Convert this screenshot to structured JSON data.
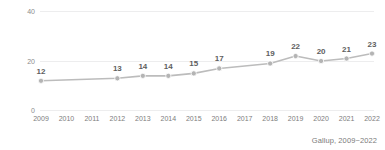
{
  "chart_data": {
    "type": "line",
    "title": "",
    "subtitle": "",
    "xlabel": "",
    "ylabel": "",
    "categories": [
      "2009",
      "2010",
      "2011",
      "2012",
      "2013",
      "2014",
      "2015",
      "2016",
      "2017",
      "2018",
      "2019",
      "2020",
      "2021",
      "2022"
    ],
    "values": [
      12,
      null,
      null,
      13,
      14,
      14,
      15,
      17,
      null,
      19,
      22,
      20,
      21,
      23
    ],
    "point_labels": [
      "12",
      "",
      "",
      "13",
      "14",
      "14",
      "15",
      "17",
      "",
      "19",
      "22",
      "20",
      "21",
      "23"
    ],
    "series": [
      {
        "name": "",
        "x": [
          "2009",
          "2012",
          "2013",
          "2014",
          "2015",
          "2016",
          "2018",
          "2019",
          "2020",
          "2021",
          "2022"
        ],
        "values": [
          12,
          13,
          14,
          14,
          15,
          17,
          19,
          22,
          20,
          21,
          23
        ]
      }
    ],
    "ylim": [
      0,
      40
    ],
    "y_ticks": [
      "0",
      "20",
      "40"
    ],
    "y_tick_values": [
      0,
      20,
      40
    ],
    "x_ticks": [
      "2009",
      "2010",
      "2011",
      "2012",
      "2013",
      "2014",
      "2015",
      "2016",
      "2017",
      "2018",
      "2019",
      "2020",
      "2021",
      "2022"
    ],
    "grid": true,
    "legend": false,
    "legend_position": "none",
    "show_data_labels": true,
    "marker": "circle"
  },
  "source": {
    "note": "Gallup, 2009~2022"
  },
  "colors": {
    "line": "#bcbcbc",
    "marker": "#b4b4b4",
    "gridline": "#ededee",
    "axis_text": "#8b8b8b",
    "value_text": "#5e5e5e",
    "background": "#ffffff"
  }
}
